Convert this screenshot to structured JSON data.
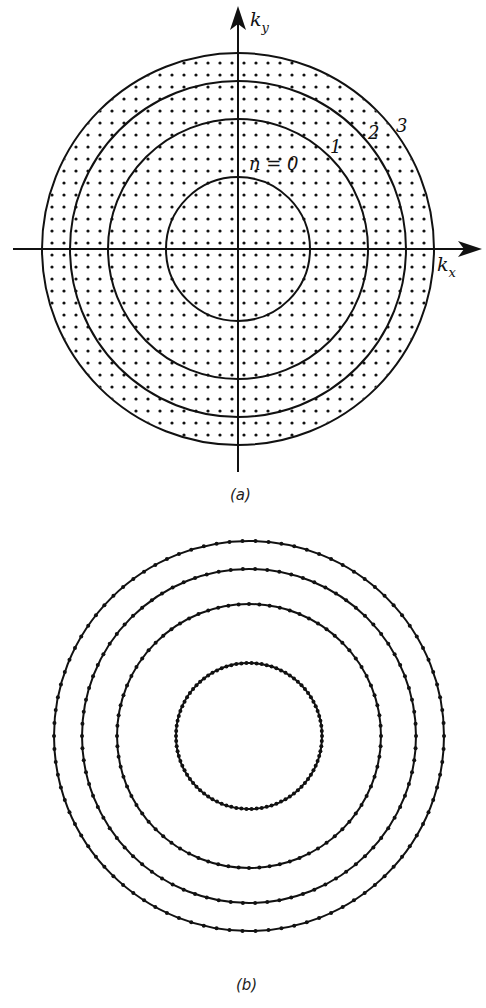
{
  "figure_a": {
    "caption": "(a)",
    "axis_x_label": "k",
    "axis_x_sub": "x",
    "axis_y_label": "k",
    "axis_y_sub": "y",
    "center": [
      238,
      249
    ],
    "circle_radii": [
      72,
      130,
      168,
      196
    ],
    "circle_labels": [
      {
        "text": "n = 0",
        "x": 262,
        "y": 168
      },
      {
        "text": "1",
        "x": 333,
        "y": 150
      },
      {
        "text": "2",
        "x": 370,
        "y": 138
      },
      {
        "text": "3",
        "x": 398,
        "y": 130
      }
    ],
    "lattice_spacing": 12,
    "ink_color": "#111111"
  },
  "figure_b": {
    "caption": "(b)",
    "center": [
      249,
      736
    ],
    "circle_radii": [
      73,
      132,
      167,
      195
    ],
    "dots_per_circle": [
      90,
      80,
      86,
      94
    ],
    "ink_color": "#111111"
  }
}
